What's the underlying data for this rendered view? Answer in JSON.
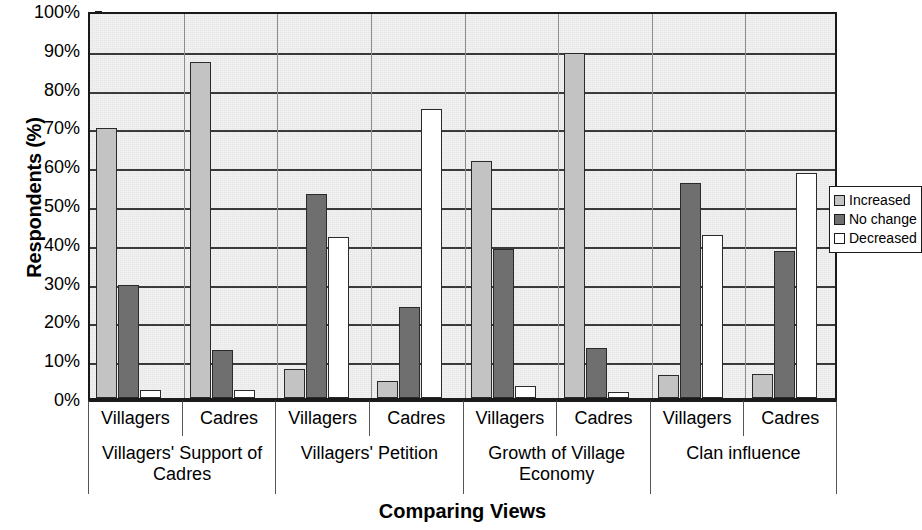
{
  "chart_data": {
    "type": "bar",
    "title": "",
    "xlabel": "Comparing Views",
    "ylabel": "Respondents (%)",
    "ylim": [
      0,
      100
    ],
    "ytick_labels": [
      "0%",
      "10%",
      "20%",
      "30%",
      "40%",
      "50%",
      "60%",
      "70%",
      "80%",
      "90%",
      "100%"
    ],
    "ytick_values": [
      0,
      10,
      20,
      30,
      40,
      50,
      60,
      70,
      80,
      90,
      100
    ],
    "grid": true,
    "legend_position": "right",
    "plot_background": "#ebebeb",
    "series": [
      {
        "name": "Increased",
        "color": "#c3c3c3",
        "values": [
          69.5,
          86.5,
          7.5,
          4.5,
          61.0,
          89.0,
          6.0,
          6.3
        ]
      },
      {
        "name": "No change",
        "color": "#6f6f6f",
        "values": [
          29.0,
          12.5,
          52.5,
          23.5,
          38.3,
          12.8,
          55.5,
          38.0
        ]
      },
      {
        "name": "Decreased",
        "color": "#ffffff",
        "values": [
          2.0,
          2.0,
          41.5,
          74.5,
          3.0,
          1.5,
          42.0,
          58.0
        ]
      }
    ],
    "categories": [
      "Villagers",
      "Cadres",
      "Villagers",
      "Cadres",
      "Villagers",
      "Cadres",
      "Villagers",
      "Cadres"
    ],
    "category_groups": [
      {
        "label": "Villagers' Support of Cadres",
        "span": 2
      },
      {
        "label": "Villagers' Petition",
        "span": 2
      },
      {
        "label": "Growth of Village Economy",
        "span": 2
      },
      {
        "label": "Clan influence",
        "span": 2
      }
    ]
  },
  "legend": {
    "items": [
      {
        "label": "Increased",
        "swatch": "increased"
      },
      {
        "label": "No change",
        "swatch": "nochange"
      },
      {
        "label": "Decreased",
        "swatch": "decreased"
      }
    ]
  }
}
